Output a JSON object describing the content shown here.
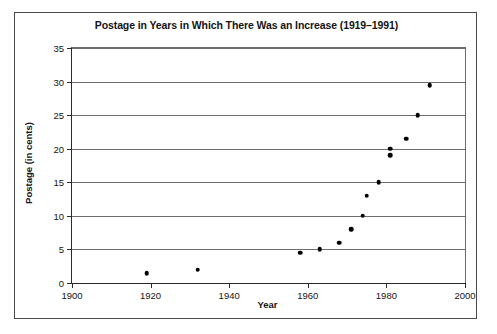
{
  "chart_data": {
    "type": "scatter",
    "title": "Postage in Years in Which There Was an Increase (1919–1991)",
    "xlabel": "Year",
    "ylabel": "Postage (in cents)",
    "xlim": [
      1900,
      2000
    ],
    "ylim": [
      0,
      35
    ],
    "xticks": [
      1900,
      1920,
      1940,
      1960,
      1980,
      2000
    ],
    "yticks": [
      0,
      5,
      10,
      15,
      20,
      25,
      30,
      35
    ],
    "grid": true,
    "legend": null,
    "x": [
      1919,
      1932,
      1958,
      1963,
      1968,
      1971,
      1974,
      1975,
      1978,
      1981,
      1981,
      1985,
      1988,
      1991
    ],
    "y": [
      1.5,
      2,
      4.5,
      5,
      6,
      8,
      10,
      13,
      15,
      19,
      20,
      21.5,
      25,
      29.5
    ],
    "points": [
      {
        "x": 1919,
        "y": 1.5
      },
      {
        "x": 1932,
        "y": 2
      },
      {
        "x": 1958,
        "y": 4.5
      },
      {
        "x": 1963,
        "y": 5
      },
      {
        "x": 1968,
        "y": 6
      },
      {
        "x": 1971,
        "y": 8
      },
      {
        "x": 1974,
        "y": 10
      },
      {
        "x": 1975,
        "y": 13
      },
      {
        "x": 1978,
        "y": 15
      },
      {
        "x": 1981,
        "y": 19
      },
      {
        "x": 1981,
        "y": 20
      },
      {
        "x": 1985,
        "y": 21.5
      },
      {
        "x": 1988,
        "y": 25
      },
      {
        "x": 1991,
        "y": 29.5
      }
    ]
  }
}
